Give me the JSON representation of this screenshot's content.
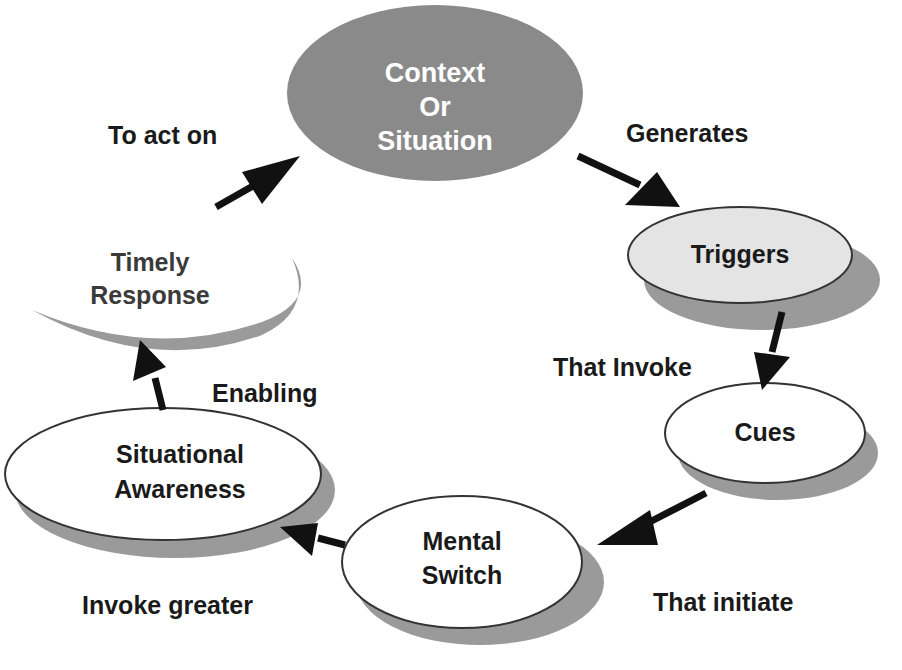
{
  "diagram": {
    "type": "cycle",
    "colors": {
      "context_fill": "#8a8a8a",
      "triggers_fill": "#e4e4e4",
      "node_fill": "#ffffff",
      "shadow": "#9a9a9a",
      "arrow": "#111111",
      "text": "#1a1a1a"
    },
    "nodes": {
      "context": {
        "line1": "Context",
        "line2": "Or",
        "line3": "Situation"
      },
      "triggers": {
        "label": "Triggers"
      },
      "cues": {
        "label": "Cues"
      },
      "mental_switch": {
        "line1": "Mental",
        "line2": "Switch"
      },
      "situational_awareness": {
        "line1": "Situational",
        "line2": "Awareness"
      },
      "timely_response": {
        "line1": "Timely",
        "line2": "Response"
      }
    },
    "edges": {
      "context_to_triggers": "Generates",
      "triggers_to_cues": "That Invoke",
      "cues_to_mental_switch": "That initiate",
      "mental_switch_to_awareness": "Invoke greater",
      "awareness_to_response": "Enabling",
      "response_to_context": "To act on"
    }
  }
}
